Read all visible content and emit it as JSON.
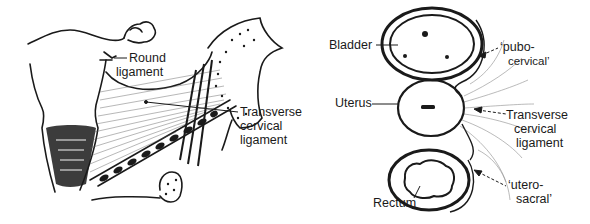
{
  "figure": {
    "left_panel": {
      "name": "sagittal-view",
      "labels": {
        "round_ligament": [
          "Round",
          "ligament"
        ],
        "transverse_cervical_ligament": [
          "Transverse",
          "cervical",
          "ligament"
        ]
      }
    },
    "right_panel": {
      "name": "cross-section-view",
      "labels": {
        "bladder": "Bladder",
        "uterus": "Uterus",
        "rectum": "Rectum",
        "pubocervical": [
          "‘pubo-",
          "cervical’"
        ],
        "transverse_cervical_ligament": [
          "Transverse",
          "cervical",
          "ligament"
        ],
        "uterosacral": [
          "‘utero-",
          "sacral’"
        ]
      }
    },
    "colors": {
      "ink": "#1a1a1a",
      "background": "#ffffff"
    }
  }
}
